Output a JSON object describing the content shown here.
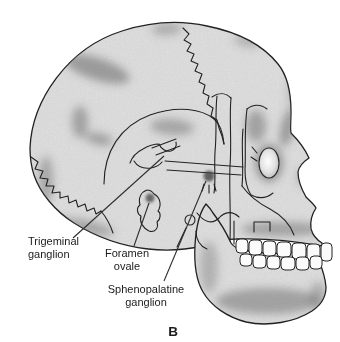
{
  "figure": {
    "panel_letter": "B",
    "annotations": {
      "trigeminal": {
        "line1": "Trigeminal",
        "line2": "ganglion"
      },
      "foramen_ovale": {
        "line1": "Foramen",
        "line2": "ovale"
      },
      "sphenopalatine": {
        "line1": "Sphenopalatine",
        "line2": "ganglion"
      }
    }
  },
  "colors": {
    "background": "#ffffff",
    "bone": "#e9e9e9",
    "bone-deep": "#d7d7d7",
    "outline": "#222222",
    "shading": "#6f6f6f",
    "marker": "#3f3f3f",
    "leader": "#2e2e2e",
    "tooth": "#fbfbfb",
    "label-text": "#1b1b1b"
  }
}
